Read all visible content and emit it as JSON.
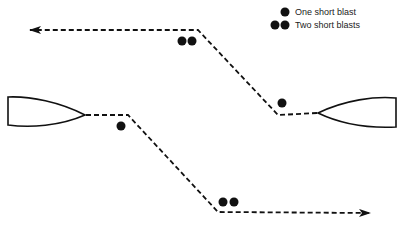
{
  "diagram": {
    "title": "",
    "legend": {
      "items": [
        {
          "symbol": "one-dot",
          "label": "One short blast"
        },
        {
          "symbol": "two-dots",
          "label": "Two short blasts"
        }
      ]
    },
    "vessels": [
      {
        "id": "left-vessel",
        "heading": "east",
        "signal": "One short blast",
        "path": "turns starboard, then heads east"
      },
      {
        "id": "right-vessel",
        "heading": "west",
        "signal": "One short blast",
        "path": "turns starboard, then heads west"
      }
    ],
    "signals_on_diagram": [
      {
        "location": "top course change",
        "type": "Two short blasts"
      },
      {
        "location": "right vessel initial turn",
        "type": "One short blast"
      },
      {
        "location": "left vessel initial turn",
        "type": "One short blast"
      },
      {
        "location": "bottom course change",
        "type": "Two short blasts"
      }
    ],
    "colors": {
      "ink": "#111111",
      "background": "#ffffff"
    }
  }
}
